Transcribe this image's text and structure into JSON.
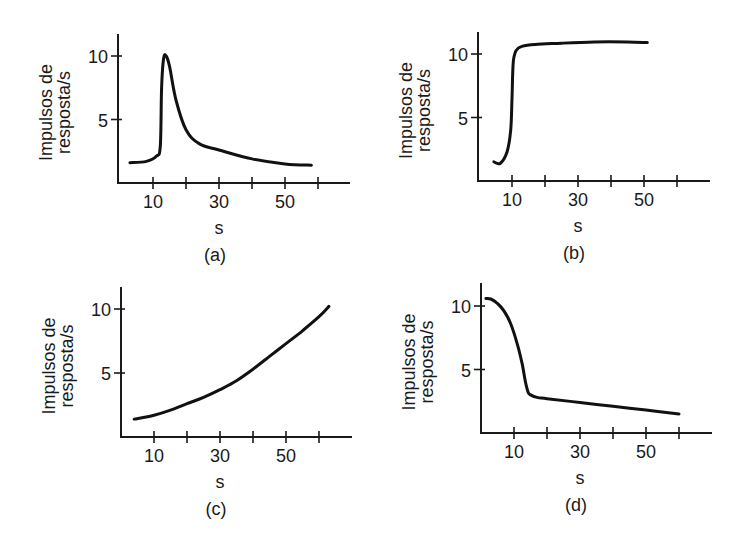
{
  "chart_data": [
    {
      "id": "a",
      "type": "line",
      "caption": "(a)",
      "xlabel": "s",
      "ylabel_lines": [
        "Impulsos de",
        "resposta/s"
      ],
      "x_ticks": [
        10,
        20,
        30,
        40,
        50,
        60
      ],
      "x_tick_labels": {
        "10": "10",
        "30": "30",
        "50": "50"
      },
      "y_ticks": [
        5,
        10
      ],
      "y_tick_labels": [
        "5",
        "10"
      ],
      "xlim": [
        0,
        70
      ],
      "ylim": [
        0,
        12
      ],
      "grid": false,
      "series": [
        {
          "name": "resposta",
          "x": [
            3,
            8,
            11,
            12.2,
            12.6,
            13.2,
            14,
            15,
            17,
            20,
            24,
            30,
            40,
            50,
            58
          ],
          "y": [
            1.6,
            1.7,
            2.1,
            2.9,
            7.5,
            9.8,
            10.0,
            9.2,
            6.5,
            4.2,
            3.1,
            2.6,
            1.9,
            1.5,
            1.4
          ]
        }
      ],
      "layout": {
        "origin_x": 118,
        "origin_y": 183,
        "x0_px": 120,
        "px_per_x": 3.3,
        "px_per_y": 12.7,
        "y_top": 34,
        "x_end": 350
      }
    },
    {
      "id": "b",
      "type": "line",
      "caption": "(b)",
      "xlabel": "s",
      "ylabel_lines": [
        "Impulsos de",
        "resposta/s"
      ],
      "x_ticks": [
        10,
        20,
        30,
        40,
        50,
        60
      ],
      "x_tick_labels": {
        "10": "10",
        "30": "30",
        "50": "50"
      },
      "y_ticks": [
        5,
        10
      ],
      "y_tick_labels": [
        "5",
        "10"
      ],
      "xlim": [
        0,
        70
      ],
      "ylim": [
        0,
        12
      ],
      "grid": false,
      "series": [
        {
          "name": "resposta",
          "x": [
            4.5,
            6.5,
            8.5,
            9.6,
            10,
            10.2,
            10.5,
            11.3,
            13,
            17,
            25,
            35,
            45,
            51
          ],
          "y": [
            1.5,
            1.4,
            2.3,
            4.0,
            6.5,
            8.5,
            9.6,
            10.3,
            10.6,
            10.75,
            10.85,
            10.95,
            10.95,
            10.9
          ]
        }
      ],
      "layout": {
        "origin_x": 478,
        "origin_y": 181,
        "x0_px": 479,
        "px_per_x": 3.3,
        "px_per_y": 12.7,
        "y_top": 32,
        "x_end": 710
      }
    },
    {
      "id": "c",
      "type": "line",
      "caption": "(c)",
      "xlabel": "s",
      "ylabel_lines": [
        "Impulsos de",
        "resposta/s"
      ],
      "x_ticks": [
        10,
        20,
        30,
        40,
        50,
        60
      ],
      "x_tick_labels": {
        "10": "10",
        "30": "30",
        "50": "50"
      },
      "y_ticks": [
        5,
        10
      ],
      "y_tick_labels": [
        "5",
        "10"
      ],
      "xlim": [
        0,
        70
      ],
      "ylim": [
        0,
        12
      ],
      "grid": false,
      "series": [
        {
          "name": "resposta",
          "x": [
            4,
            10,
            15,
            20,
            25,
            30,
            35,
            40,
            45,
            50,
            55,
            60,
            63
          ],
          "y": [
            1.4,
            1.7,
            2.1,
            2.6,
            3.1,
            3.7,
            4.4,
            5.3,
            6.3,
            7.3,
            8.3,
            9.4,
            10.2
          ]
        }
      ],
      "layout": {
        "origin_x": 121,
        "origin_y": 437,
        "x0_px": 121,
        "px_per_x": 3.3,
        "px_per_y": 12.8,
        "y_top": 287,
        "x_end": 352
      }
    },
    {
      "id": "d",
      "type": "line",
      "caption": "(d)",
      "xlabel": "s",
      "ylabel_lines": [
        "Impulsos de",
        "resposta/s"
      ],
      "x_ticks": [
        10,
        20,
        30,
        40,
        50,
        60
      ],
      "x_tick_labels": {
        "10": "10",
        "30": "30",
        "50": "50"
      },
      "y_ticks": [
        5,
        10
      ],
      "y_tick_labels": [
        "5",
        "10"
      ],
      "xlim": [
        0,
        70
      ],
      "ylim": [
        0,
        12
      ],
      "grid": false,
      "series": [
        {
          "name": "resposta",
          "x": [
            1.5,
            3,
            5,
            7,
            9,
            11,
            12.5,
            13.5,
            14.3,
            15,
            17,
            20,
            30,
            40,
            50,
            60
          ],
          "y": [
            10.6,
            10.55,
            10.2,
            9.6,
            8.6,
            7.0,
            5.4,
            4.0,
            3.2,
            3.0,
            2.8,
            2.7,
            2.4,
            2.1,
            1.8,
            1.5
          ]
        }
      ],
      "layout": {
        "origin_x": 481,
        "origin_y": 433,
        "x0_px": 481,
        "px_per_x": 3.3,
        "px_per_y": 12.7,
        "y_top": 283,
        "x_end": 712
      }
    }
  ]
}
